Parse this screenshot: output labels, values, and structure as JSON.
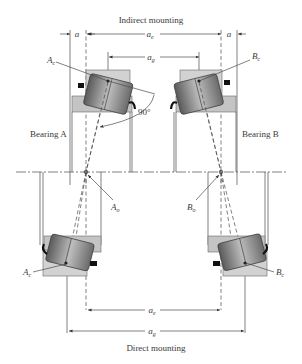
{
  "diagram": {
    "top_caption": "Indirect mounting",
    "bottom_caption": "Direct mounting",
    "labels": {
      "bearing_a": "Bearing A",
      "bearing_b": "Bearing B",
      "angle": "90°",
      "a_left": "a",
      "a_right": "a",
      "ae_top": {
        "main": "a",
        "sub": "e"
      },
      "ag_top": {
        "main": "a",
        "sub": "g"
      },
      "ae_bottom": {
        "main": "a",
        "sub": "e"
      },
      "ag_bottom": {
        "main": "a",
        "sub": "g"
      },
      "Ac_top": {
        "main": "A",
        "sub": "c"
      },
      "Bc_top": {
        "main": "B",
        "sub": "c"
      },
      "Ao": {
        "main": "A",
        "sub": "o"
      },
      "Bo": {
        "main": "B",
        "sub": "o"
      },
      "Ac_bottom": {
        "main": "A",
        "sub": "c"
      },
      "Bc_bottom": {
        "main": "B",
        "sub": "c"
      }
    },
    "colors": {
      "line": "#4a4a4a",
      "housing": "#d2d2d2",
      "roller_dark": "#5a5a5a",
      "roller_light": "#bdbdbd",
      "seal": "#111111"
    }
  }
}
